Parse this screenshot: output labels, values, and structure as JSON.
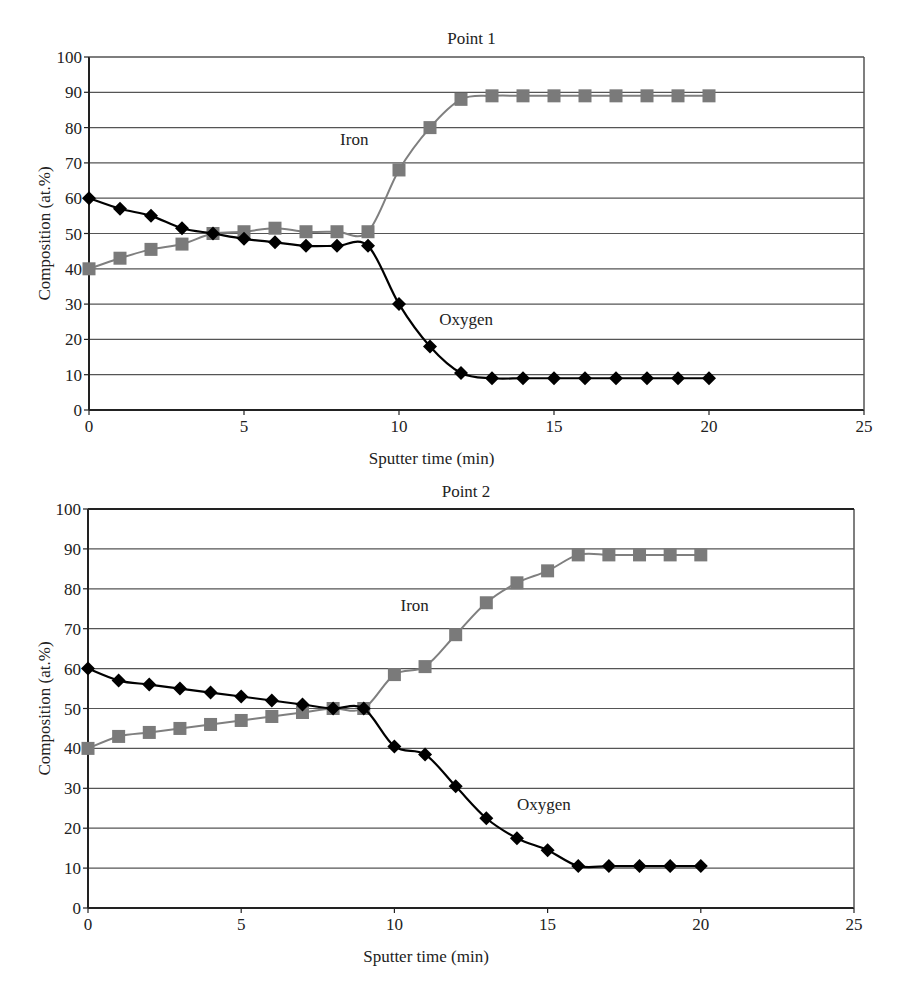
{
  "chart_data": [
    {
      "type": "line",
      "title": "Point 1",
      "xlabel": "Sputter time (min)",
      "ylabel": "Composition (at.%)",
      "xlim": [
        0,
        25
      ],
      "ylim": [
        0,
        100
      ],
      "xticks": [
        0,
        5,
        10,
        15,
        20,
        25
      ],
      "yticks": [
        0,
        10,
        20,
        30,
        40,
        50,
        60,
        70,
        80,
        90,
        100
      ],
      "grid": "horizontal",
      "legend": "none (inline annotations)",
      "x": [
        0,
        1,
        2,
        3,
        4,
        5,
        6,
        7,
        8,
        9,
        10,
        11,
        12,
        13,
        14,
        15,
        16,
        17,
        18,
        19,
        20
      ],
      "series": [
        {
          "name": "Iron",
          "marker": "square",
          "color": "#808080",
          "values": [
            40,
            43,
            45.5,
            47,
            50,
            50.5,
            51.5,
            50.5,
            50.5,
            50.5,
            68,
            80,
            88,
            89,
            89,
            89,
            89,
            89,
            89,
            89,
            89
          ]
        },
        {
          "name": "Oxygen",
          "marker": "diamond",
          "color": "#000000",
          "values": [
            60,
            57,
            55,
            51.5,
            50,
            48.5,
            47.5,
            46.5,
            46.5,
            46.5,
            30,
            18,
            10.5,
            9,
            9,
            9,
            9,
            9,
            9,
            9,
            9
          ]
        }
      ],
      "annotations": [
        {
          "text": "Iron",
          "x": 8.1,
          "y": 75
        },
        {
          "text": "Oxygen",
          "x": 11.3,
          "y": 24
        }
      ]
    },
    {
      "type": "line",
      "title": "Point 2",
      "xlabel": "Sputter time (min)",
      "ylabel": "Composition (at.%)",
      "xlim": [
        0,
        25
      ],
      "ylim": [
        0,
        100
      ],
      "xticks": [
        0,
        5,
        10,
        15,
        20,
        25
      ],
      "yticks": [
        0,
        10,
        20,
        30,
        40,
        50,
        60,
        70,
        80,
        90,
        100
      ],
      "grid": "horizontal",
      "legend": "none (inline annotations)",
      "x": [
        0,
        1,
        2,
        3,
        4,
        5,
        6,
        7,
        8,
        9,
        10,
        11,
        12,
        13,
        14,
        15,
        16,
        17,
        18,
        19,
        20
      ],
      "series": [
        {
          "name": "Iron",
          "marker": "square",
          "color": "#808080",
          "values": [
            40,
            43,
            44,
            45,
            46,
            47,
            48,
            49,
            50,
            50,
            58.5,
            60.5,
            68.5,
            76.5,
            81.5,
            84.5,
            88.5,
            88.5,
            88.5,
            88.5,
            88.5
          ]
        },
        {
          "name": "Oxygen",
          "marker": "diamond",
          "color": "#000000",
          "values": [
            60,
            57,
            56,
            55,
            54,
            53,
            52,
            51,
            50,
            50,
            40.5,
            38.5,
            30.5,
            22.5,
            17.5,
            14.5,
            10.5,
            10.5,
            10.5,
            10.5,
            10.5
          ]
        }
      ],
      "annotations": [
        {
          "text": "Iron",
          "x": 10.2,
          "y": 74.5
        },
        {
          "text": "Oxygen",
          "x": 14.0,
          "y": 24.5
        }
      ]
    }
  ],
  "layout": [
    {
      "left": 89,
      "right": 864,
      "top": 57,
      "bottom": 410,
      "title_y": 44,
      "xlabel_y": 464
    },
    {
      "left": 88,
      "right": 854,
      "top": 509,
      "bottom": 908,
      "title_y": 497,
      "xlabel_y": 962
    }
  ]
}
